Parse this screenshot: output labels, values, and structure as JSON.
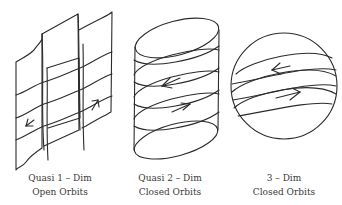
{
  "figure": {
    "panels": [
      {
        "id": "quasi-1-dim",
        "shape": "sheet",
        "caption_line1": "Quasi 1 – Dim",
        "caption_line2": "Open Orbits"
      },
      {
        "id": "quasi-2-dim",
        "shape": "cylinder",
        "caption_line1": "Quasi 2 – Dim",
        "caption_line2": "Closed Orbits"
      },
      {
        "id": "3-dim",
        "shape": "sphere",
        "caption_line1": "3 – Dim",
        "caption_line2": "Closed Orbits"
      }
    ],
    "colors": {
      "stroke": "#2b2b2b",
      "text": "#3a3a3a",
      "background": "#ffffff"
    }
  }
}
